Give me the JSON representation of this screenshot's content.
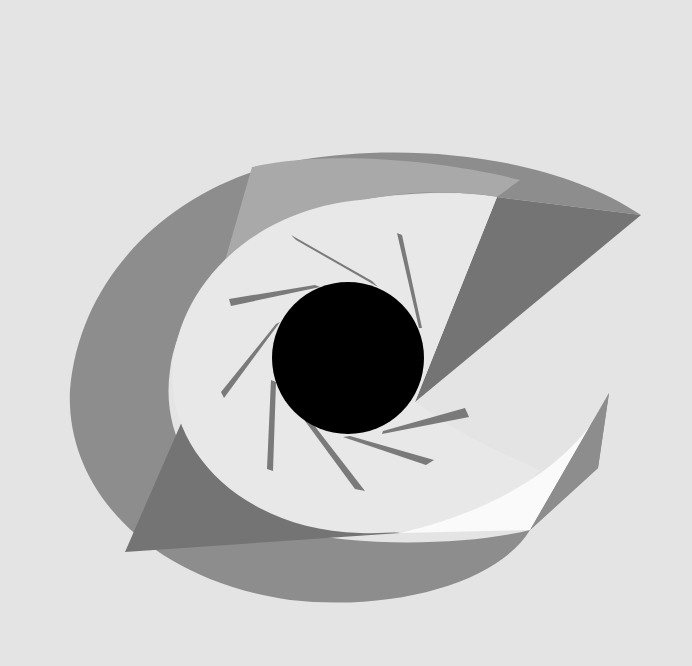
{
  "artwork": {
    "title": "Abstract geometric eye",
    "colors": {
      "background": "#e4e4e4",
      "outer_band": "#8d8d8d",
      "dark_facet": "#747474",
      "light_facet": "#a9a9a9",
      "inner_eye": "#e8e8e8",
      "highlight": "#fafafa",
      "blade": "#7a7a7a",
      "pupil": "#000000"
    },
    "pupil": {
      "cx": 348,
      "cy": 358,
      "r": 76
    },
    "blade_count": 8
  }
}
